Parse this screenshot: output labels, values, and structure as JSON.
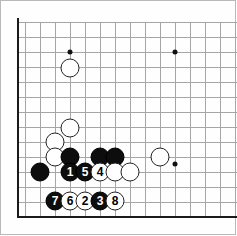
{
  "figure": {
    "kind": "go-board-diagram",
    "title": "",
    "board": {
      "grid_spacing_px": 15,
      "origin_x_px": 55,
      "origin_y_px": 22,
      "columns_visible": 13,
      "rows_visible": 13,
      "edge_color": "#1a1a1a",
      "grid_color": "#a6a6a6",
      "background_color": "#fefefe",
      "left_edge_x_px": 17,
      "bottom_edge_y_px": 216
    },
    "grid": {
      "horizontal_y_px": [
        22,
        37,
        52,
        67,
        82,
        97,
        112,
        127,
        142,
        157,
        172,
        187,
        202
      ],
      "vertical_x_px": [
        25,
        40,
        55,
        70,
        85,
        100,
        115,
        130,
        145,
        160,
        175,
        190,
        205,
        220,
        235
      ]
    },
    "star_points": [
      {
        "name": "star-point-upper-left",
        "x": 70,
        "y": 52
      },
      {
        "name": "star-point-upper-right",
        "x": 175,
        "y": 52
      },
      {
        "name": "star-point-lower-right",
        "x": 175,
        "y": 164
      }
    ],
    "stones": [
      {
        "id": "white-a",
        "color": "white",
        "label": "",
        "x": 70,
        "y": 68
      },
      {
        "id": "white-b",
        "color": "white",
        "label": "",
        "x": 70,
        "y": 128
      },
      {
        "id": "white-c",
        "color": "white",
        "label": "",
        "x": 55,
        "y": 142
      },
      {
        "id": "white-d",
        "color": "white",
        "label": "",
        "x": 55,
        "y": 157
      },
      {
        "id": "black-a",
        "color": "black",
        "label": "",
        "x": 70,
        "y": 157
      },
      {
        "id": "black-b",
        "color": "black",
        "label": "",
        "x": 100,
        "y": 157
      },
      {
        "id": "black-c",
        "color": "black",
        "label": "",
        "x": 115,
        "y": 157
      },
      {
        "id": "white-e",
        "color": "white",
        "label": "",
        "x": 160,
        "y": 157
      },
      {
        "id": "black-d",
        "color": "black",
        "label": "",
        "x": 40,
        "y": 172
      },
      {
        "id": "move-1",
        "color": "black",
        "label": "1",
        "x": 70,
        "y": 172
      },
      {
        "id": "move-5",
        "color": "black",
        "label": "5",
        "x": 85,
        "y": 172
      },
      {
        "id": "move-4",
        "color": "white",
        "label": "4",
        "x": 100,
        "y": 172
      },
      {
        "id": "white-f",
        "color": "white",
        "label": "",
        "x": 115,
        "y": 172
      },
      {
        "id": "white-g",
        "color": "white",
        "label": "",
        "x": 130,
        "y": 172
      },
      {
        "id": "move-7",
        "color": "black",
        "label": "7",
        "x": 55,
        "y": 201
      },
      {
        "id": "move-6",
        "color": "white",
        "label": "6",
        "x": 70,
        "y": 201
      },
      {
        "id": "move-2",
        "color": "white",
        "label": "2",
        "x": 85,
        "y": 201
      },
      {
        "id": "move-3",
        "color": "black",
        "label": "3",
        "x": 100,
        "y": 201
      },
      {
        "id": "move-8",
        "color": "white",
        "label": "8",
        "x": 115,
        "y": 201
      }
    ]
  }
}
